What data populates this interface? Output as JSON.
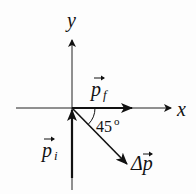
{
  "diagram": {
    "title": "",
    "axes": {
      "x_label": "x",
      "y_label": "y"
    },
    "vectors": [
      {
        "name": "p_f",
        "label": "p",
        "subscript": "f",
        "direction": "+x"
      },
      {
        "name": "p_i",
        "label": "p",
        "subscript": "i",
        "direction": "+y (incoming from below)"
      },
      {
        "name": "delta_p",
        "label": "Δp",
        "subscript": "",
        "direction": "-45° below +x"
      }
    ],
    "angle": {
      "value": "45",
      "unit_symbol": "o",
      "between": [
        "p_f",
        "delta_p"
      ]
    },
    "colors": {
      "ink": "#111111",
      "background": "#fdfdfd"
    }
  }
}
